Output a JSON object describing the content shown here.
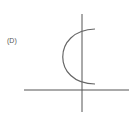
{
  "diagram": {
    "option_label": "(D)",
    "axes": {
      "x_axis": {
        "x1": 24,
        "y1": 90,
        "x2": 129,
        "y2": 90
      },
      "y_axis": {
        "x1": 82,
        "y1": 14,
        "x2": 82,
        "y2": 112
      }
    },
    "curve": {
      "description": "left-opening C-shaped arc (sideways parabola)",
      "path": "M 95 29 C 52 30, 52 84, 95 84"
    },
    "colors": {
      "axis": "#555555",
      "curve": "#666666",
      "label": "#555555",
      "background": "#ffffff"
    }
  }
}
